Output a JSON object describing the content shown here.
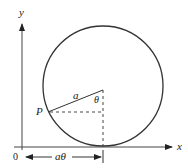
{
  "diagram": {
    "type": "cycloid-geometry",
    "axes": {
      "x_label": "x",
      "y_label": "y",
      "origin_label": "0"
    },
    "circle": {
      "center": [
        103,
        86
      ],
      "radius": 60
    },
    "labels": {
      "point": "P",
      "radius": "a",
      "angle": "θ",
      "arc_length": "aθ"
    },
    "colors": {
      "stroke": "#333333",
      "text": "#222222",
      "background": "#ffffff"
    }
  }
}
